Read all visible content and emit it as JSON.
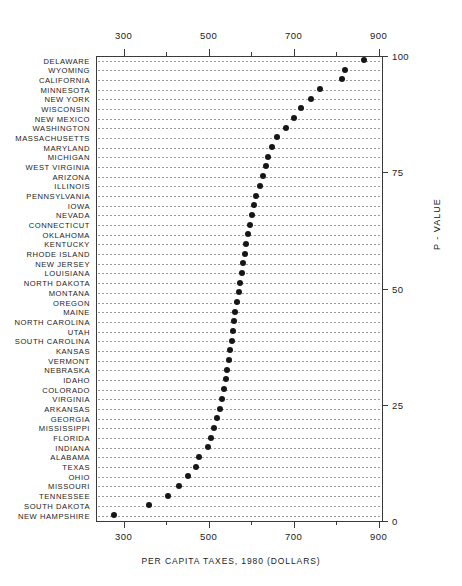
{
  "chart_data": {
    "type": "scatter",
    "title": "",
    "xlabel": "PER CAPITA TAXES, 1980 (DOLLARS)",
    "ylabel": "P - VALUE",
    "xlim": [
      235,
      910
    ],
    "ylim": [
      0,
      100
    ],
    "grid": "dotted-row-leaders",
    "legend": "none",
    "x_ticks_major": [
      300,
      500,
      700,
      900
    ],
    "x_ticks_minor": [
      400,
      600,
      800
    ],
    "x_tick_labels": [
      "300",
      "500",
      "700",
      "900"
    ],
    "y_ticks": [
      0,
      25,
      50,
      75,
      100
    ],
    "y_tick_labels": [
      "0",
      "25",
      "50",
      "75",
      "100"
    ],
    "categories": [
      "DELAWARE",
      "WYOMING",
      "CALIFORNIA",
      "MINNESOTA",
      "NEW YORK",
      "WISCONSIN",
      "NEW MEXICO",
      "WASHINGTON",
      "MASSACHUSETTS",
      "MARYLAND",
      "MICHIGAN",
      "WEST VIRGINIA",
      "ARIZONA",
      "ILLINOIS",
      "PENNSYLVANIA",
      "IOWA",
      "NEVADA",
      "CONNECTICUT",
      "OKLAHOMA",
      "KENTUCKY",
      "RHODE ISLAND",
      "NEW JERSEY",
      "LOUISIANA",
      "NORTH DAKOTA",
      "MONTANA",
      "OREGON",
      "MAINE",
      "NORTH CAROLINA",
      "UTAH",
      "SOUTH CAROLINA",
      "KANSAS",
      "VERMONT",
      "NEBRASKA",
      "IDAHO",
      "COLORADO",
      "VIRGINIA",
      "ARKANSAS",
      "GEORGIA",
      "MISSISSIPPI",
      "FLORIDA",
      "INDIANA",
      "ALABAMA",
      "TEXAS",
      "OHIO",
      "MISSOURI",
      "TENNESSEE",
      "SOUTH DAKOTA",
      "NEW HAMPSHIRE"
    ],
    "values": [
      866,
      821,
      813,
      762,
      740,
      717,
      700,
      681,
      660,
      648,
      640,
      634,
      628,
      621,
      612,
      607,
      602,
      598,
      593,
      589,
      585,
      582,
      578,
      574,
      571,
      567,
      563,
      560,
      557,
      554,
      551,
      547,
      543,
      540,
      536,
      532,
      527,
      520,
      513,
      506,
      499,
      478,
      470,
      452,
      430,
      404,
      360,
      277
    ],
    "p_values": [
      100,
      98,
      96,
      94,
      92,
      90,
      88,
      85,
      83,
      81,
      79,
      77,
      75,
      73,
      71,
      69,
      67,
      65,
      62,
      60,
      58,
      56,
      54,
      52,
      50,
      48,
      46,
      44,
      42,
      40,
      37,
      35,
      33,
      31,
      29,
      27,
      25,
      23,
      21,
      19,
      17,
      15,
      12,
      10,
      8,
      6,
      4,
      2
    ]
  },
  "layout": {
    "plot_left_px": 96,
    "plot_right_px": 382,
    "plot_top_px": 56,
    "plot_bottom_px": 521,
    "x_value_at_left_px": 235,
    "x_value_at_right_px": 908
  }
}
